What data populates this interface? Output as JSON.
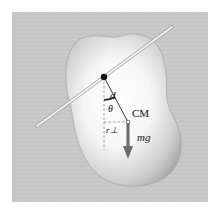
{
  "figure": {
    "labels": {
      "distance": "d",
      "angle": "θ",
      "center_of_mass": "CM",
      "perpendicular_distance": "r⊥",
      "weight_force": "mg⃗"
    },
    "colors": {
      "background": "#c8c8c8",
      "body": "#e8e8e8",
      "arrow": "#6a6a6a",
      "rod": "#f0f0f0"
    }
  }
}
